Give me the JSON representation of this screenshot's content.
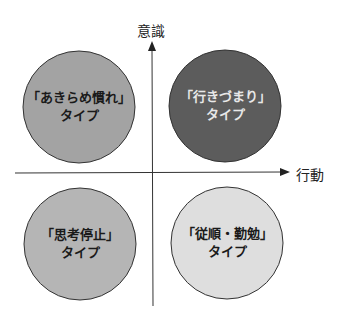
{
  "axes": {
    "y_label": "意識",
    "x_label": "行動"
  },
  "quadrants": [
    {
      "position": "top-left",
      "name": "「あきらめ慣れ」",
      "suffix": "タイプ",
      "fill": "#a3a3a3",
      "text_color": "#1a1a1a"
    },
    {
      "position": "top-right",
      "name": "「行きづまり」",
      "suffix": "タイプ",
      "fill": "#5c5c5c",
      "text_color": "#e8e8e8"
    },
    {
      "position": "bottom-left",
      "name": "「思考停止」",
      "suffix": "タイプ",
      "fill": "#b5b5b5",
      "text_color": "#1a1a1a"
    },
    {
      "position": "bottom-right",
      "name": "「従順・勤勉」",
      "suffix": "タイプ",
      "fill": "#dedede",
      "text_color": "#1a1a1a"
    }
  ]
}
